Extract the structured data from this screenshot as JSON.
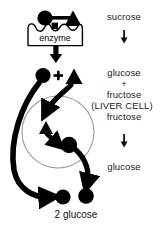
{
  "figure": {
    "title_visible": false,
    "background": "#ffffff",
    "ink": "#000000",
    "cell_outline": "#8a8a8a"
  },
  "labels": {
    "enzyme": "enzyme",
    "bottom_total": "2 glucose"
  },
  "pathway_text": {
    "step1": "sucrose",
    "arrow1": "↓",
    "step2_a": "glucose",
    "step2_plus": "+",
    "step2_b": "fructose",
    "cell_name": "(LIVER CELL)",
    "step3": "fructose",
    "arrow2": "↓",
    "step4": "glucose"
  },
  "shapes": {
    "sucrose_glucose_circle": {
      "cx": 45,
      "cy": 18,
      "r": 7.5,
      "fill": "#000000"
    },
    "sucrose_fructose_triangle": {
      "cx": 73,
      "cy": 19,
      "size": 8.5,
      "fill": "#000000"
    },
    "bond_label": "glycosidic-bond",
    "free_glucose_circle": {
      "cx": 43,
      "cy": 75,
      "r": 7.5,
      "fill": "#000000"
    },
    "free_fructose_triangle": {
      "cx": 74,
      "cy": 77,
      "size": 8.5,
      "fill": "#000000"
    },
    "cell_fructose_triangle": {
      "cx": 46,
      "cy": 128,
      "size": 7.5,
      "fill": "#000000"
    },
    "cell_glucose_circle": {
      "cx": 69,
      "cy": 145,
      "r": 8,
      "fill": "#000000"
    },
    "product_glucose_left": {
      "cx": 63,
      "cy": 197,
      "r": 7.5,
      "fill": "#000000"
    },
    "product_glucose_right": {
      "cx": 86,
      "cy": 196,
      "r": 7.5,
      "fill": "#000000"
    },
    "liver_cell_circle": {
      "cx": 58,
      "cy": 132,
      "r": 36,
      "stroke": "#8a8a8a"
    }
  },
  "text_positions": {
    "sucrose": {
      "x": 124,
      "y": 17
    },
    "arrow1": {
      "x": 124,
      "y": 36
    },
    "glucose1": {
      "x": 124,
      "y": 74
    },
    "plus": {
      "x": 124,
      "y": 85
    },
    "fructose1": {
      "x": 124,
      "y": 96
    },
    "liver_cell": {
      "x": 124,
      "y": 107
    },
    "fructose2": {
      "x": 124,
      "y": 118
    },
    "arrow2": {
      "x": 124,
      "y": 140
    },
    "glucose2": {
      "x": 124,
      "y": 167
    },
    "enzyme": {
      "x": 55,
      "y": 37
    },
    "total": {
      "x": 76,
      "y": 214
    }
  }
}
